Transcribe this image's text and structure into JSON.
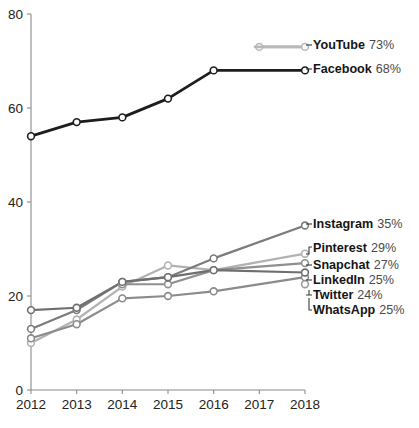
{
  "chart_data": {
    "type": "line",
    "title": "",
    "subtitle": "",
    "xlabel": "",
    "ylabel": "",
    "x": [
      2012,
      2013,
      2014,
      2015,
      2016,
      2017,
      2018
    ],
    "xtick_labels": [
      "2012",
      "2013",
      "2014",
      "2015",
      "2016",
      "2017",
      "2018"
    ],
    "ytick_labels": [
      "0",
      "20",
      "40",
      "60",
      "80"
    ],
    "yticks": [
      0,
      20,
      40,
      60,
      80
    ],
    "ylim": [
      0,
      80
    ],
    "xlim": [
      2012,
      2018
    ],
    "grid": false,
    "legend_position": "right-inline",
    "series": [
      {
        "name": "YouTube",
        "value_label": "73%",
        "final_value": 73,
        "color": "#b8b8b8",
        "stroke_width": 2.6,
        "x": [
          2017,
          2018
        ],
        "values": [
          73,
          73
        ]
      },
      {
        "name": "Facebook",
        "value_label": "68%",
        "final_value": 68,
        "color": "#1d1d1d",
        "stroke_width": 2.8,
        "x": [
          2012,
          2013,
          2014,
          2015,
          2016,
          2018
        ],
        "values": [
          54,
          57,
          58,
          62,
          68,
          68
        ]
      },
      {
        "name": "Instagram",
        "value_label": "35%",
        "final_value": 35,
        "color": "#7b7b7b",
        "stroke_width": 2.2,
        "x": [
          2012,
          2013,
          2014,
          2015,
          2016,
          2018
        ],
        "values": [
          13,
          17,
          23,
          24,
          28,
          35
        ]
      },
      {
        "name": "Pinterest",
        "value_label": "29%",
        "final_value": 29,
        "color": "#b2b2b2",
        "stroke_width": 2.2,
        "x": [
          2012,
          2013,
          2014,
          2015,
          2016,
          2018
        ],
        "values": [
          10,
          15,
          22,
          26.5,
          25.5,
          29
        ]
      },
      {
        "name": "Snapchat",
        "value_label": "27%",
        "final_value": 27,
        "color": "#8f8f8f",
        "stroke_width": 2.2,
        "x": [
          2014,
          2015,
          2016,
          2018
        ],
        "values": [
          22.5,
          22.5,
          25.5,
          27
        ]
      },
      {
        "name": "LinkedIn",
        "value_label": "25%",
        "final_value": 25,
        "color": "#6f6f6f",
        "stroke_width": 2.2,
        "x": [
          2012,
          2013,
          2014,
          2015,
          2016,
          2018
        ],
        "values": [
          17,
          17.5,
          23,
          24,
          25.5,
          25
        ]
      },
      {
        "name": "Twitter",
        "value_label": "24%",
        "final_value": 24,
        "color": "#8b8b8b",
        "stroke_width": 2.2,
        "x": [
          2012,
          2013,
          2014,
          2015,
          2016,
          2018
        ],
        "values": [
          11,
          14,
          19.5,
          20,
          21,
          24
        ]
      },
      {
        "name": "WhatsApp",
        "value_label": "25%",
        "final_value": 25,
        "color": "#9a9a9a",
        "stroke_width": 2.2,
        "x": [],
        "values": []
      }
    ],
    "legend_entries": [
      {
        "name": "YouTube",
        "value_label": "73%"
      },
      {
        "name": "Facebook",
        "value_label": "68%"
      },
      {
        "name": "Instagram",
        "value_label": "35%"
      },
      {
        "name": "Pinterest",
        "value_label": "29%"
      },
      {
        "name": "Snapchat",
        "value_label": "27%"
      },
      {
        "name": "LinkedIn",
        "value_label": "25%"
      },
      {
        "name": "Twitter",
        "value_label": "24%"
      },
      {
        "name": "WhatsApp",
        "value_label": "25%"
      }
    ]
  },
  "colors": {
    "axis": "#8a8a8a",
    "text": "#222222",
    "legend_name": "#151515",
    "legend_pct": "#4a4a4a",
    "background": "#ffffff"
  }
}
